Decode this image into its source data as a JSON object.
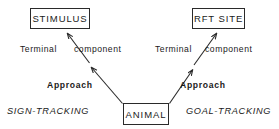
{
  "diagram": {
    "nodes": {
      "stimulus": "STIMULUS",
      "rft_site": "RFT SITE",
      "animal": "ANIMAL"
    },
    "edge_labels": {
      "terminal_left": "Terminal",
      "component_left": "component",
      "terminal_right": "Terminal",
      "component_right": "component",
      "approach_left": "Approach",
      "approach_right": "Approach"
    },
    "outcome_labels": {
      "sign_tracking": "SIGN-TRACKING",
      "goal_tracking": "GOAL-TRACKING"
    },
    "colors": {
      "ink": "#1a1a1a",
      "stroke": "#2a2a2a",
      "background": "#ffffff"
    }
  }
}
